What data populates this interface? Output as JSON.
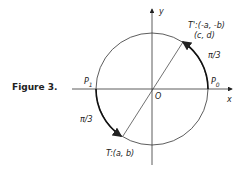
{
  "figure": {
    "caption": "Figure 3.",
    "axes": {
      "x_label": "x",
      "y_label": "y",
      "origin_label": "O"
    },
    "points": {
      "p0": "P",
      "p0_sub": "0",
      "p1": "P",
      "p1_sub": "1",
      "t_prime_line1": "T':(-a, -b)",
      "t_prime_line2": "(c, d)",
      "t": "T:(a, b)"
    },
    "arc_labels": {
      "upper_right": "π/3",
      "lower_left": "π/3"
    }
  }
}
